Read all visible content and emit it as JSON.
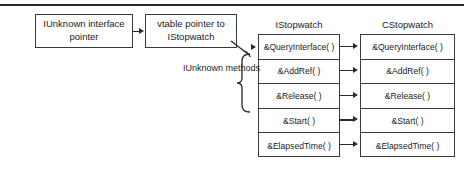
{
  "diagram": {
    "title_rule": "top-divider",
    "colors": {
      "line": "#2b2b2b",
      "box_border": "#3a3a3a",
      "text": "#1d1d1d",
      "background": "#ffffff"
    },
    "nodes": {
      "iunknown_pointer": "IUnknown interface pointer",
      "vtable_pointer": "vtable pointer to IStopwatch"
    },
    "labels": {
      "iunknown_methods": "IUnknown methods"
    },
    "columns": [
      {
        "header": "IStopwatch",
        "methods": [
          "&QueryInterface( )",
          "&AddRef( )",
          "&Release( )",
          "&Start( )",
          "&ElapsedTime( )"
        ]
      },
      {
        "header": "CStopwatch",
        "methods": [
          "&QueryInterface( )",
          "&AddRef( )",
          "&Release( )",
          "&Start( )",
          "&ElapsedTime( )"
        ]
      }
    ]
  }
}
